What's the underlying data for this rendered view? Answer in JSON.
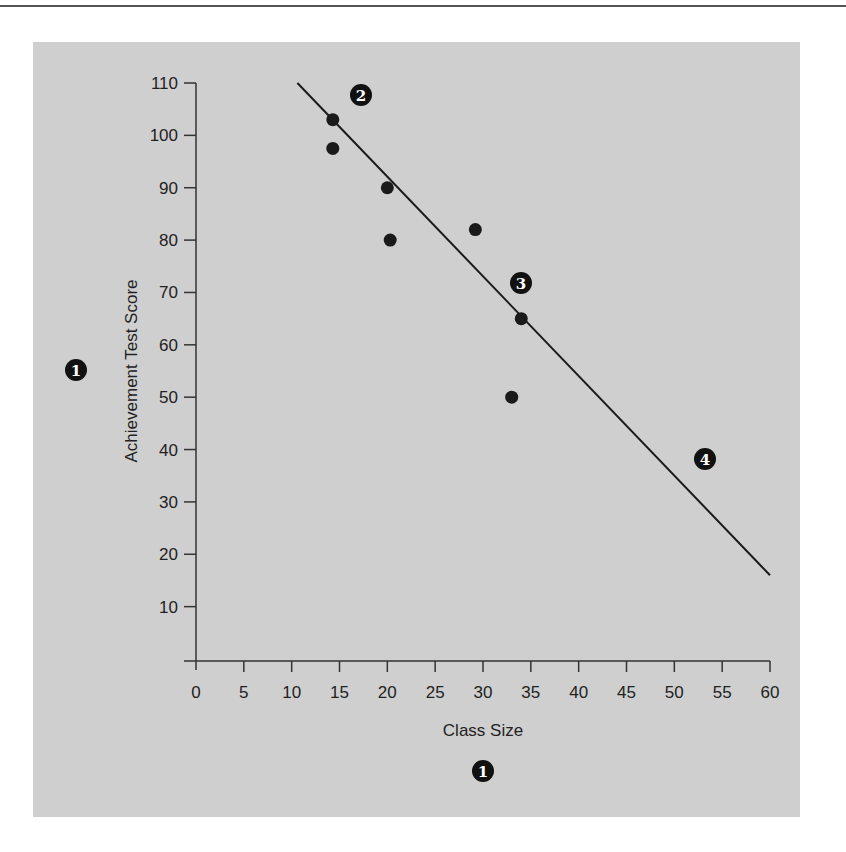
{
  "chart_data": {
    "type": "scatter",
    "title": "",
    "xlabel": "Class Size",
    "ylabel": "Achievement Test Score",
    "xlim": [
      0,
      60
    ],
    "ylim": [
      0,
      110
    ],
    "x_ticks": [
      0,
      5,
      10,
      15,
      20,
      25,
      30,
      35,
      40,
      45,
      50,
      55,
      60
    ],
    "y_ticks": [
      10,
      20,
      30,
      40,
      50,
      60,
      70,
      80,
      90,
      100,
      110
    ],
    "grid": false,
    "legend": null,
    "series": [
      {
        "name": "Classes",
        "type": "scatter",
        "points": [
          {
            "x": 14.3,
            "y": 103
          },
          {
            "x": 14.3,
            "y": 97.5
          },
          {
            "x": 20,
            "y": 90
          },
          {
            "x": 20.3,
            "y": 80
          },
          {
            "x": 29.2,
            "y": 82
          },
          {
            "x": 34,
            "y": 65
          },
          {
            "x": 33,
            "y": 50
          }
        ]
      },
      {
        "name": "Regression line",
        "type": "line",
        "points": [
          {
            "x": 10.6,
            "y": 110
          },
          {
            "x": 60,
            "y": 16
          }
        ]
      }
    ],
    "annotations": [
      {
        "label": "1",
        "near": "y-axis title"
      },
      {
        "label": "1",
        "near": "x-axis title"
      },
      {
        "label": "2",
        "x": 17,
        "y": 107
      },
      {
        "label": "3",
        "x": 33.6,
        "y": 72
      },
      {
        "label": "4",
        "x": 53,
        "y": 38.5
      }
    ]
  },
  "labels": {
    "xlabel": "Class Size",
    "ylabel": "Achievement Test Score",
    "x_ticks": [
      "0",
      "5",
      "10",
      "15",
      "20",
      "25",
      "30",
      "35",
      "40",
      "45",
      "50",
      "55",
      "60"
    ],
    "y_ticks": [
      "10",
      "20",
      "30",
      "40",
      "50",
      "60",
      "70",
      "80",
      "90",
      "100",
      "110"
    ],
    "callouts": [
      "1",
      "1",
      "2",
      "3",
      "4"
    ]
  },
  "colors": {
    "panel": "#cfcfcf",
    "ink": "#1a1a1a"
  }
}
